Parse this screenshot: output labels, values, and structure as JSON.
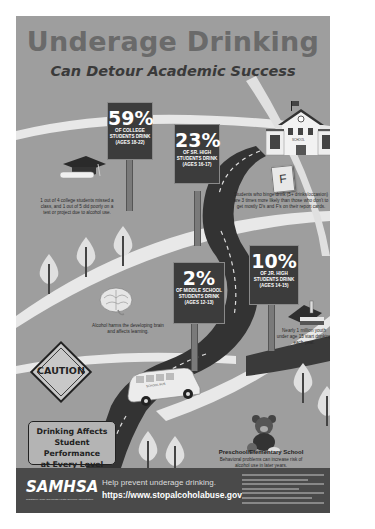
{
  "header": {
    "title": "Underage Drinking",
    "subtitle": "Can Detour Academic Success"
  },
  "signs": [
    {
      "percent": "59%",
      "label_line1": "of college",
      "label_line2": "students drink",
      "ages": "(ages 18-22)"
    },
    {
      "percent": "23%",
      "label_line1": "of sr. high",
      "label_line2": "students drink",
      "ages": "(ages 16-17)"
    },
    {
      "percent": "2%",
      "label_line1": "of middle school",
      "label_line2": "students drink",
      "ages": "(ages 12-13)"
    },
    {
      "percent": "10%",
      "label_line1": "of jr. high",
      "label_line2": "students drink",
      "ages": "(ages 14-15)"
    }
  ],
  "notes": {
    "college": "1 out of 4 college students missed a class, and 1 out of 5 did poorly on a test or project due to alcohol use.",
    "high_school": "Students who binge drink (5+ drinks/occasion) are 3 times more likely than those who don't to get mostly D's and F's on their report cards.",
    "middle_school": "Alcohol harms the developing brain and affects learning.",
    "jr_high": "Nearly 1 million youth under age 15 start drinking each year.",
    "preschool_title": "Preschool/Elementary School",
    "preschool_body": "Behavioral problems can increase risk of alcohol use in later years."
  },
  "illustrations": {
    "school_label": "SCHOOL",
    "grade_card": "F",
    "caution_sign": "CAUTION",
    "bus_label": "SCHOOL BUS"
  },
  "callout": {
    "line1": "Drinking Affects",
    "line2": "Student Performance",
    "line3": "at Every Level"
  },
  "footer": {
    "logo": "SAMHSA",
    "logo_sub": "Substance Abuse and Mental Health Services Administration",
    "help_text": "Help prevent underage drinking.",
    "url": "https://www.stopalcoholabuse.gov"
  },
  "colors": {
    "background": "#9e9e9e",
    "sign": "#3c3c3c",
    "road": "#333333",
    "footer": "#4a4a4a",
    "title": "#6a6a6a"
  }
}
